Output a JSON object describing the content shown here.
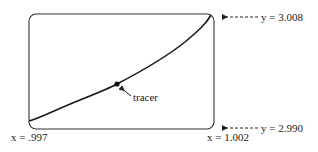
{
  "window": {
    "xmin_label": "x = .997",
    "xmax_label": "x = 1.002",
    "ymax_label": "y = 3.008",
    "ymin_label": "y = 2.990"
  },
  "tracer": {
    "label": "tracer"
  },
  "colors": {
    "stroke": "#1a1a1a",
    "text": "#222222"
  }
}
